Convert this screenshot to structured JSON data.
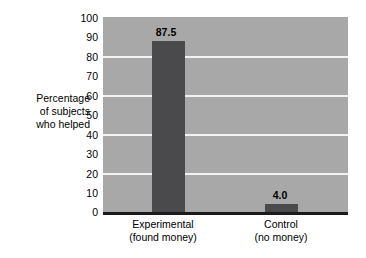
{
  "chart_data": {
    "type": "bar",
    "title": "",
    "xlabel": "",
    "ylabel": "Percentage of subjects who helped",
    "ylabel_lines": [
      "Percentage",
      "of subjects",
      "who helped"
    ],
    "categories": [
      "Experimental (found money)",
      "Control (no money)"
    ],
    "category_lines": [
      [
        "Experimental",
        "(found money)"
      ],
      [
        "Control",
        "(no money)"
      ]
    ],
    "values": [
      87.5,
      4.0
    ],
    "value_labels": [
      "87.5",
      "4.0"
    ],
    "ylim": [
      0,
      100
    ],
    "ytick_values": [
      0,
      10,
      20,
      30,
      40,
      50,
      60,
      70,
      80,
      90,
      100
    ],
    "ytick_labels": [
      "0",
      "10",
      "20",
      "30",
      "40",
      "50",
      "60",
      "70",
      "80",
      "90",
      "100"
    ],
    "gridlines_at": [
      20,
      40,
      60,
      80
    ],
    "grid": true,
    "legend": false,
    "legend_position": "none",
    "colors": {
      "bar": "#4a4a4c",
      "plot_background": "#a8a8a8",
      "gridline": "#f2f2f2",
      "axis": "#1a1a1a",
      "text": "#000000",
      "page_background": "#ffffff"
    }
  }
}
